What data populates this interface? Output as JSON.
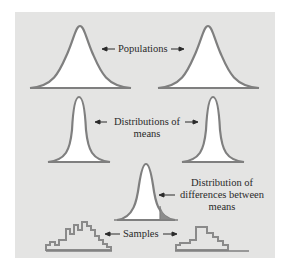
{
  "diagram": {
    "labels": {
      "populations": "Populations",
      "distributions_of_means_line1": "Distributions of",
      "distributions_of_means_line2": "means",
      "difference_line1": "Distribution of",
      "difference_line2": "differences between",
      "difference_line3": "means",
      "samples": "Samples"
    },
    "colors": {
      "background": "#e4e4e3",
      "curve_stroke": "#7f7f7f",
      "curve_fill": "#ffffff",
      "shaded_tail": "#8c8c8c",
      "text": "#2a2a2a"
    }
  }
}
